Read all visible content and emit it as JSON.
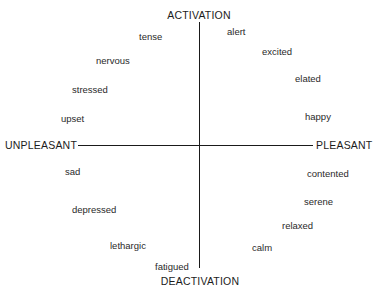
{
  "figure": {
    "background_color": "#ffffff",
    "line_color": "#1a1a1a",
    "text_color": "#2a2a2a"
  },
  "axes": {
    "vertical": {
      "top_label": "ACTIVATION",
      "bottom_label": "DEACTIVATION"
    },
    "horizontal": {
      "left_label": "UNPLEASANT",
      "right_label": "PLEASANT"
    }
  },
  "chart_data": {
    "type": "scatter",
    "title": "",
    "xlabel": "UNPLEASANT — PLEASANT",
    "ylabel": "DEACTIVATION — ACTIVATION",
    "xlim": [
      -1,
      1
    ],
    "ylim": [
      -1,
      1
    ],
    "grid": false,
    "legend": false,
    "axis_labels": {
      "x_left": "UNPLEASANT",
      "x_right": "PLEASANT",
      "y_top": "ACTIVATION",
      "y_bottom": "DEACTIVATION"
    },
    "points": [
      {
        "label": "tense",
        "quadrant": "unpleasant-activation",
        "x": -0.5,
        "y": 0.88,
        "px": 139,
        "py": 31
      },
      {
        "label": "nervous",
        "quadrant": "unpleasant-activation",
        "x": -0.74,
        "y": 0.68,
        "px": 96,
        "py": 55
      },
      {
        "label": "stressed",
        "quadrant": "unpleasant-activation",
        "x": -0.88,
        "y": 0.44,
        "px": 72,
        "py": 84
      },
      {
        "label": "upset",
        "quadrant": "unpleasant-activation",
        "x": -0.97,
        "y": 0.2,
        "px": 61,
        "py": 113
      },
      {
        "label": "alert",
        "quadrant": "pleasant-activation",
        "x": 0.22,
        "y": 0.95,
        "px": 227,
        "py": 26
      },
      {
        "label": "excited",
        "quadrant": "pleasant-activation",
        "x": 0.52,
        "y": 0.78,
        "px": 262,
        "py": 46
      },
      {
        "label": "elated",
        "quadrant": "pleasant-activation",
        "x": 0.8,
        "y": 0.56,
        "px": 295,
        "py": 73
      },
      {
        "label": "happy",
        "quadrant": "pleasant-activation",
        "x": 0.92,
        "y": 0.24,
        "px": 305,
        "py": 111
      },
      {
        "label": "contented",
        "quadrant": "pleasant-deactivation",
        "x": 0.92,
        "y": -0.22,
        "px": 307,
        "py": 168
      },
      {
        "label": "serene",
        "quadrant": "pleasant-deactivation",
        "x": 0.84,
        "y": -0.46,
        "px": 304,
        "py": 196
      },
      {
        "label": "relaxed",
        "quadrant": "pleasant-deactivation",
        "x": 0.68,
        "y": -0.66,
        "px": 282,
        "py": 220
      },
      {
        "label": "calm",
        "quadrant": "pleasant-deactivation",
        "x": 0.44,
        "y": -0.84,
        "px": 252,
        "py": 242
      },
      {
        "label": "sad",
        "quadrant": "unpleasant-deactivation",
        "x": -0.94,
        "y": -0.2,
        "px": 65,
        "py": 166
      },
      {
        "label": "depressed",
        "quadrant": "unpleasant-deactivation",
        "x": -0.82,
        "y": -0.54,
        "px": 72,
        "py": 204
      },
      {
        "label": "lethargic",
        "quadrant": "unpleasant-deactivation",
        "x": -0.54,
        "y": -0.82,
        "px": 110,
        "py": 240
      },
      {
        "label": "fatigued",
        "quadrant": "unpleasant-deactivation",
        "x": -0.22,
        "y": -0.96,
        "px": 155,
        "py": 261
      }
    ]
  }
}
